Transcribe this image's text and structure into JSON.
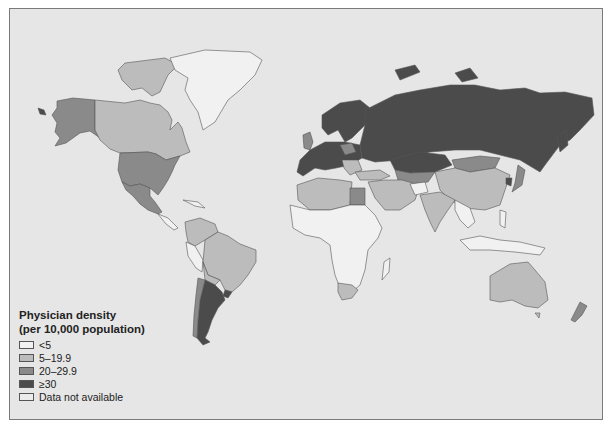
{
  "map": {
    "title": "Physician density",
    "subtitle": "(per 10,000 population)",
    "background_color": "#e6e6e6",
    "legend": [
      {
        "label": "<5",
        "color": "#f1f1f1"
      },
      {
        "label": "5–19.9",
        "color": "#bcbcbc"
      },
      {
        "label": "20–29.9",
        "color": "#8a8a8a"
      },
      {
        "label": "≥30",
        "color": "#4b4b4b"
      },
      {
        "label": "Data not available",
        "color": "#ececec"
      }
    ],
    "regions": [
      {
        "name": "Alaska/USA",
        "category": "20–29.9"
      },
      {
        "name": "Canada",
        "category": "5–19.9"
      },
      {
        "name": "Greenland",
        "category": "Data not available"
      },
      {
        "name": "United States",
        "category": "20–29.9"
      },
      {
        "name": "Mexico",
        "category": "20–29.9"
      },
      {
        "name": "Brazil",
        "category": "5–19.9"
      },
      {
        "name": "Argentina",
        "category": "≥30"
      },
      {
        "name": "Uruguay",
        "category": "≥30"
      },
      {
        "name": "Russia",
        "category": "≥30"
      },
      {
        "name": "Europe",
        "category": "≥30"
      },
      {
        "name": "Kazakhstan",
        "category": "≥30"
      },
      {
        "name": "Mongolia",
        "category": "20–29.9"
      },
      {
        "name": "China",
        "category": "5–19.9"
      },
      {
        "name": "India",
        "category": "5–19.9"
      },
      {
        "name": "Egypt",
        "category": "20–29.9"
      },
      {
        "name": "Africa (most)",
        "category": "<5"
      },
      {
        "name": "South Africa",
        "category": "5–19.9"
      },
      {
        "name": "Australia",
        "category": "5–19.9"
      },
      {
        "name": "New Zealand",
        "category": "20–29.9"
      },
      {
        "name": "Japan",
        "category": "20–29.9"
      }
    ]
  }
}
